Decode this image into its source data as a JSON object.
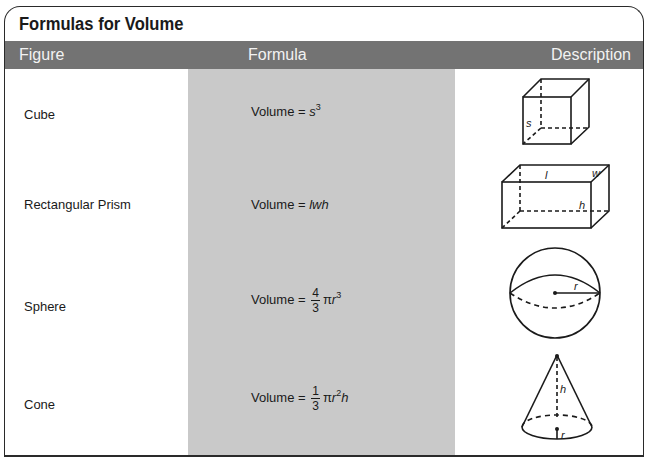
{
  "title": "Formulas for Volume",
  "columns": {
    "figure": "Figure",
    "formula": "Formula",
    "description": "Description"
  },
  "rows": [
    {
      "figure": "Cube",
      "formula_prefix": "Volume = ",
      "formula_var": "s",
      "formula_exp": "3",
      "diagram": "cube-diagram",
      "labels": {
        "s": "s"
      }
    },
    {
      "figure": "Rectangular Prism",
      "formula_prefix": "Volume = ",
      "formula_var": "lwh",
      "diagram": "rectangular-prism-diagram",
      "labels": {
        "l": "l",
        "w": "w",
        "h": "h"
      }
    },
    {
      "figure": "Sphere",
      "formula_prefix": "Volume = ",
      "frac_num": "4",
      "frac_den": "3",
      "formula_pi": "π",
      "formula_var": "r",
      "formula_exp": "3",
      "diagram": "sphere-diagram",
      "labels": {
        "r": "r"
      }
    },
    {
      "figure": "Cone",
      "formula_prefix": "Volume = ",
      "frac_num": "1",
      "frac_den": "3",
      "formula_pi": "π",
      "formula_var": "r",
      "formula_exp": "2",
      "formula_suffix": "h",
      "diagram": "cone-diagram",
      "labels": {
        "h": "h",
        "r": "r"
      }
    }
  ],
  "colors": {
    "header_bg": "#737373",
    "header_text": "#f2f2f2",
    "formula_column_bg": "#c9c9c9",
    "border": "#2a2a2a"
  }
}
